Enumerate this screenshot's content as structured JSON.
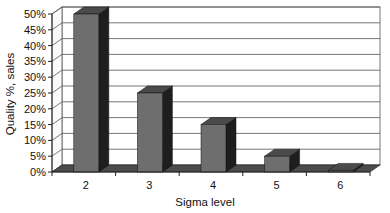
{
  "chart_data": {
    "type": "bar",
    "style": "3d-column",
    "title": "",
    "xlabel": "Sigma level",
    "ylabel": "Quality %, sales",
    "categories": [
      "2",
      "3",
      "4",
      "5",
      "6"
    ],
    "values": [
      50,
      25,
      15,
      5,
      0.5
    ],
    "value_unit": "%",
    "ylim": [
      0,
      50
    ],
    "yticks": [
      0,
      5,
      10,
      15,
      20,
      25,
      30,
      35,
      40,
      45,
      50
    ],
    "ytick_labels": [
      "0%",
      "5%",
      "10%",
      "15%",
      "20%",
      "25%",
      "30%",
      "35%",
      "40%",
      "45%",
      "50%"
    ],
    "grid": true,
    "legend": null
  },
  "colors": {
    "bar_front": "#6e6e6e",
    "bar_top": "#4a4a4a",
    "bar_side": "#1e1e1e",
    "floor": "#4c4c4c",
    "gridline": "#555555",
    "wall": "#ffffff",
    "axis": "#222222"
  }
}
